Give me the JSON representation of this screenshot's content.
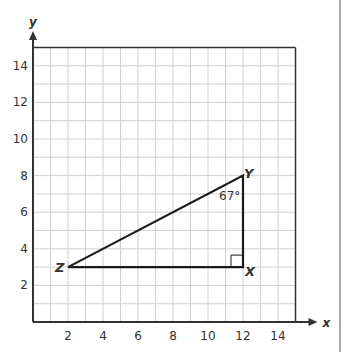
{
  "diagram": {
    "type": "coordinate-plane-right-triangle",
    "axes": {
      "x_label": "x",
      "y_label": "y",
      "x_ticks": [
        "2",
        "4",
        "6",
        "8",
        "10",
        "12",
        "14"
      ],
      "y_ticks": [
        "2",
        "4",
        "6",
        "8",
        "10",
        "12",
        "14"
      ],
      "x_range": [
        0,
        15
      ],
      "y_range": [
        0,
        15
      ],
      "grid_step": 1
    },
    "triangle": {
      "vertices": [
        {
          "label": "Z",
          "x": 2,
          "y": 3
        },
        {
          "label": "X",
          "x": 12,
          "y": 3
        },
        {
          "label": "Y",
          "x": 12,
          "y": 8
        }
      ],
      "angle_label": "67°",
      "angle_at": "Y",
      "right_angle_at": "X"
    },
    "colors": {
      "axis": "#333333",
      "grid": "#d0d0d0",
      "triangle": "#1a1a1a",
      "text": "#333333"
    }
  }
}
